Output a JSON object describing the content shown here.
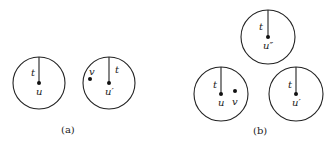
{
  "figure": {
    "panels": [
      {
        "id": "a",
        "caption": "(a)",
        "caption_pos": [
          68,
          133
        ],
        "circles": [
          {
            "cx": 39,
            "cy": 83,
            "r": 26,
            "center_label": "u",
            "radius_label": "t",
            "radius_label_side": "left",
            "extra_points": []
          },
          {
            "cx": 109,
            "cy": 83,
            "r": 26,
            "center_label": "u′",
            "radius_label": "t",
            "radius_label_side": "right",
            "extra_points": [
              {
                "x": 90,
                "y": 79,
                "label": "v",
                "label_pos": "above"
              }
            ]
          }
        ]
      },
      {
        "id": "b",
        "caption": "(b)",
        "caption_pos": [
          260,
          134
        ],
        "circles": [
          {
            "cx": 268,
            "cy": 37,
            "r": 27,
            "center_label": "u″",
            "radius_label": "t",
            "radius_label_side": "left",
            "extra_points": []
          },
          {
            "cx": 221,
            "cy": 94,
            "r": 27,
            "center_label": "u",
            "radius_label": "t",
            "radius_label_side": "left",
            "extra_points": [
              {
                "x": 235,
                "y": 91,
                "label": "v",
                "label_pos": "below"
              }
            ]
          },
          {
            "cx": 296,
            "cy": 94,
            "r": 27,
            "center_label": "u′",
            "radius_label": "t",
            "radius_label_side": "left",
            "extra_points": []
          }
        ]
      }
    ]
  }
}
